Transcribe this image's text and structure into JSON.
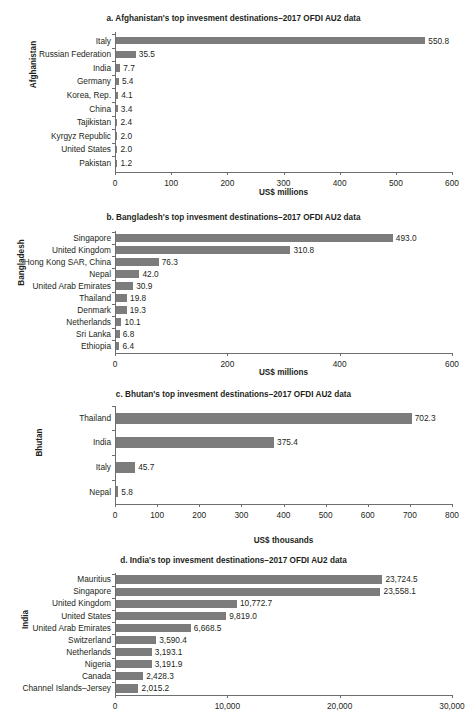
{
  "colors": {
    "bar": "#7c7c7c",
    "axis": "#6d6e71",
    "text": "#231f20"
  },
  "chart_data": [
    {
      "id": "a",
      "type": "bar",
      "orientation": "horizontal",
      "title": "a. Afghanistan's top invesment destinations–2017 OFDI AU2 data",
      "ylabel": "Afghanistan",
      "xlabel": "US$ millions",
      "xlim": [
        0,
        600
      ],
      "xticks": [
        0,
        100,
        200,
        300,
        400,
        500,
        600
      ],
      "xticklabels": [
        "0",
        "100",
        "200",
        "300",
        "400",
        "500",
        "600"
      ],
      "grid": false,
      "legend": "none",
      "categories": [
        "Italy",
        "Russian Federation",
        "India",
        "Germany",
        "Korea, Rep.",
        "China",
        "Tajikistan",
        "Kyrgyz Republic",
        "United States",
        "Pakistan"
      ],
      "values": [
        550.8,
        35.5,
        7.7,
        5.4,
        4.1,
        3.4,
        2.4,
        2.0,
        2.0,
        1.2
      ],
      "datalabels": [
        "550.8",
        "35.5",
        "7.7",
        "5.4",
        "4.1",
        "3.4",
        "2.4",
        "2.0",
        "2.0",
        "1.2"
      ]
    },
    {
      "id": "b",
      "type": "bar",
      "orientation": "horizontal",
      "title": "b. Bangladesh's top invesment destinations–2017 OFDI AU2 data",
      "ylabel": "Bangladesh",
      "xlabel": "US$ millions",
      "xlim": [
        0,
        600
      ],
      "xticks": [
        0,
        200,
        400,
        600
      ],
      "xticklabels": [
        "0",
        "200",
        "400",
        "600"
      ],
      "grid": false,
      "legend": "none",
      "categories": [
        "Singapore",
        "United Kingdom",
        "Hong Kong SAR, China",
        "Nepal",
        "United Arab Emirates",
        "Thailand",
        "Denmark",
        "Netherlands",
        "Sri Lanka",
        "Ethiopia"
      ],
      "values": [
        493.0,
        310.8,
        76.3,
        42.0,
        30.9,
        19.8,
        19.3,
        10.1,
        6.8,
        6.4
      ],
      "datalabels": [
        "493.0",
        "310.8",
        "76.3",
        "42.0",
        "30.9",
        "19.8",
        "19.3",
        "10.1",
        "6.8",
        "6.4"
      ]
    },
    {
      "id": "c",
      "type": "bar",
      "orientation": "horizontal",
      "title": "c. Bhutan's top invesment destinations–2017 OFDI AU2 data",
      "ylabel": "Bhutan",
      "xlabel": "US$ thousands",
      "xlim": [
        0,
        800
      ],
      "xticks": [
        0,
        100,
        200,
        300,
        400,
        500,
        600,
        700,
        800
      ],
      "xticklabels": [
        "0",
        "100",
        "200",
        "300",
        "400",
        "500",
        "600",
        "700",
        "800"
      ],
      "grid": false,
      "legend": "none",
      "categories": [
        "Thailand",
        "India",
        "Italy",
        "Nepal"
      ],
      "values": [
        702.3,
        375.4,
        45.7,
        5.8
      ],
      "datalabels": [
        "702.3",
        "375.4",
        "45.7",
        "5.8"
      ]
    },
    {
      "id": "d",
      "type": "bar",
      "orientation": "horizontal",
      "title": "d. India's top invesment destinations–2017 OFDI AU2 data",
      "ylabel": "India",
      "xlabel": "",
      "xlim": [
        0,
        30000
      ],
      "xticks": [
        0,
        10000,
        20000,
        30000
      ],
      "xticklabels": [
        "0",
        "10,000",
        "20,000",
        "30,000"
      ],
      "grid": false,
      "legend": "none",
      "categories": [
        "Mauritius",
        "Singapore",
        "United Kingdom",
        "United States",
        "United Arab Emirates",
        "Switzerland",
        "Netherlands",
        "Nigeria",
        "Canada",
        "Channel Islands–Jersey"
      ],
      "values": [
        23724.5,
        23558.1,
        10772.7,
        9819.0,
        6668.5,
        3590.4,
        3193.1,
        3191.9,
        2428.3,
        2015.2
      ],
      "datalabels": [
        "23,724.5",
        "23,558.1",
        "10,772.7",
        "9,819.0",
        "6,668.5",
        "3,590.4",
        "3,193.1",
        "3,191.9",
        "2,428.3",
        "2,015.2"
      ]
    }
  ],
  "layout": [
    {
      "id": "a",
      "titleTop": 14,
      "plotTop": 32,
      "plotHeight": 140,
      "rowStep": 13.6,
      "barH": 7.2,
      "xlabelTop": 189,
      "ytitleTop": 60,
      "ytitleLeft": 10
    },
    {
      "id": "b",
      "titleTop": 213,
      "plotTop": 231,
      "plotHeight": 122,
      "rowStep": 12.0,
      "barH": 8.0,
      "xlabelTop": 369,
      "ytitleTop": 258,
      "ytitleLeft": -2
    },
    {
      "id": "c",
      "titleTop": 390,
      "plotTop": 406,
      "plotHeight": 98,
      "rowStep": 24.6,
      "barH": 11.0,
      "xlabelTop": 537,
      "ytitleTop": 438,
      "ytitleLeft": 25
    },
    {
      "id": "d",
      "titleTop": 556,
      "plotTop": 573,
      "plotHeight": 122,
      "rowStep": 12.1,
      "barH": 8.3,
      "xlabelTop": 0,
      "ytitleTop": 615,
      "ytitleLeft": 16
    }
  ]
}
